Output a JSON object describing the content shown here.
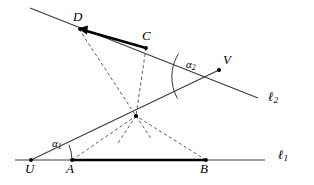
{
  "figure": {
    "background_color": "#ffffff",
    "stroke_color": "#1a1a1a",
    "thick_stroke_color": "#000000",
    "dashed_stroke_color": "#555555",
    "width": 314,
    "height": 185
  },
  "lines": {
    "l1": {
      "label": "ℓ",
      "subscript": "1",
      "label_x": 279,
      "label_y": 150,
      "x1": 15,
      "y1": 160,
      "x2": 265,
      "y2": 160
    },
    "l2": {
      "label": "ℓ",
      "subscript": "2",
      "label_x": 268,
      "label_y": 92,
      "x1": 30,
      "y1": 8,
      "x2": 258,
      "y2": 98
    }
  },
  "points": [
    {
      "name": "U",
      "x": 31,
      "y": 160,
      "label_dx": -5,
      "label_dy": 16,
      "dot": true
    },
    {
      "name": "A",
      "x": 72,
      "y": 160,
      "label_dx": -4,
      "label_dy": 16,
      "dot": true
    },
    {
      "name": "B",
      "x": 206,
      "y": 160,
      "label_dx": -4,
      "label_dy": 16,
      "dot": true
    },
    {
      "name": "D",
      "x": 79,
      "y": 29,
      "label_dx": -4,
      "label_dy": -6,
      "dot": true
    },
    {
      "name": "C",
      "x": 146,
      "y": 48,
      "label_dx": -1,
      "label_dy": -6,
      "dot": true
    },
    {
      "name": "V",
      "x": 219,
      "y": 70,
      "label_dx": 4,
      "label_dy": -5,
      "dot": true
    },
    {
      "name": "",
      "x": 136,
      "y": 116,
      "label_dx": 0,
      "label_dy": 0,
      "dot": true
    }
  ],
  "thick_segments": [
    {
      "name": "segment-AB",
      "from": "A",
      "to": "B",
      "x1": 72,
      "y1": 160,
      "x2": 206,
      "y2": 160,
      "arrow": false
    },
    {
      "name": "segment-DC",
      "from": "D",
      "to": "C",
      "x1": 79,
      "y1": 29,
      "x2": 146,
      "y2": 48,
      "arrow": true
    }
  ],
  "solid_segments": [
    {
      "name": "segment-UV",
      "from": "U",
      "to": "V",
      "x1": 31,
      "y1": 160,
      "x2": 219,
      "y2": 70
    }
  ],
  "dashed_segments": [
    {
      "name": "dashed-D-center",
      "from": "D",
      "to": "center",
      "x1": 79,
      "y1": 29,
      "x2": 136,
      "y2": 116
    },
    {
      "name": "dashed-C-center",
      "from": "C",
      "to": "center",
      "x1": 146,
      "y1": 48,
      "x2": 136,
      "y2": 116
    },
    {
      "name": "dashed-A-center",
      "from": "A",
      "to": "center",
      "x1": 72,
      "y1": 160,
      "x2": 136,
      "y2": 116
    },
    {
      "name": "dashed-B-center",
      "from": "B",
      "to": "center",
      "x1": 206,
      "y1": 160,
      "x2": 136,
      "y2": 116
    }
  ],
  "angles": [
    {
      "name": "alpha-1",
      "label": "α",
      "subscript": "1",
      "vertex": "U",
      "vx": 31,
      "vy": 160,
      "label_x": 55,
      "label_y": 141,
      "arc_path": "M 72 160 A 41 41 0 0 0 69.0 144.8"
    },
    {
      "name": "alpha-2",
      "label": "α",
      "subscript": "2",
      "vertex": "V",
      "vx": 219,
      "vy": 70,
      "label_x": 183,
      "label_y": 63,
      "arc_path": "M 178.5 53.6 A 44 44 0 0 0 177.5 98.5"
    }
  ]
}
